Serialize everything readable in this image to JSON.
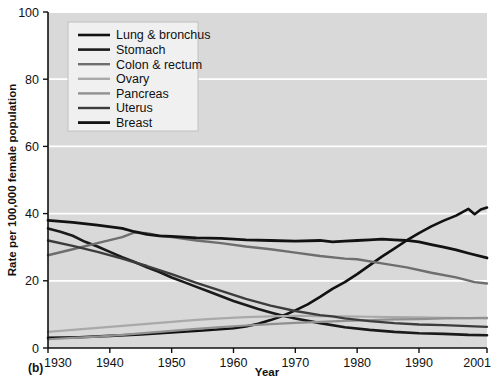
{
  "figure": {
    "panel_label": "(b)"
  },
  "chart_data": {
    "type": "line",
    "title": "",
    "xlabel": "Year",
    "ylabel": "Rate per 100,000 female population",
    "xlim": [
      1930,
      2001
    ],
    "ylim": [
      0,
      100
    ],
    "xticks": [
      1930,
      1940,
      1950,
      1960,
      1970,
      1980,
      1990,
      2001
    ],
    "xtick_labels": [
      "1930",
      "1940",
      "1950",
      "1960",
      "1970",
      "1980",
      "1990",
      "2001"
    ],
    "yticks": [
      0,
      20,
      40,
      60,
      80,
      100
    ],
    "ytick_labels": [
      "0",
      "20",
      "40",
      "60",
      "80",
      "100"
    ],
    "grid": "horizontal-white",
    "plot_background": "#d9d9d9",
    "legend_position": "top-left-inside",
    "series": [
      {
        "name": "Lung & bronchus",
        "color": "#111111",
        "width": 2.6,
        "x": [
          1930,
          1935,
          1940,
          1945,
          1950,
          1955,
          1960,
          1962,
          1964,
          1966,
          1968,
          1970,
          1972,
          1974,
          1976,
          1978,
          1980,
          1982,
          1984,
          1986,
          1988,
          1990,
          1992,
          1994,
          1996,
          1998,
          1999,
          2000,
          2001
        ],
        "values": [
          3.0,
          3.2,
          3.6,
          4.0,
          4.6,
          5.2,
          5.9,
          6.4,
          7.2,
          8.3,
          9.6,
          11.2,
          13.0,
          15.2,
          17.6,
          19.6,
          22.0,
          24.6,
          27.2,
          29.6,
          32.0,
          34.2,
          36.2,
          37.9,
          39.4,
          41.4,
          39.8,
          41.2,
          41.8
        ]
      },
      {
        "name": "Stomach",
        "color": "#1a1a1a",
        "width": 2.6,
        "x": [
          1930,
          1932,
          1934,
          1936,
          1938,
          1940,
          1942,
          1944,
          1946,
          1948,
          1950,
          1952,
          1954,
          1956,
          1958,
          1960,
          1962,
          1964,
          1966,
          1968,
          1970,
          1974,
          1978,
          1982,
          1986,
          1990,
          1994,
          1998,
          2001
        ],
        "values": [
          35.6,
          34.6,
          33.4,
          31.6,
          30.2,
          28.6,
          27.0,
          25.6,
          24.0,
          22.6,
          21.0,
          19.6,
          18.2,
          16.8,
          15.4,
          14.0,
          12.8,
          11.6,
          10.6,
          9.6,
          8.8,
          7.4,
          6.2,
          5.4,
          4.8,
          4.4,
          4.2,
          3.9,
          3.8
        ]
      },
      {
        "name": "Colon & rectum",
        "color": "#6e6e6e",
        "width": 2.4,
        "x": [
          1930,
          1934,
          1938,
          1942,
          1944,
          1946,
          1948,
          1950,
          1954,
          1958,
          1962,
          1966,
          1970,
          1974,
          1978,
          1980,
          1984,
          1988,
          1992,
          1996,
          1999,
          2001
        ],
        "values": [
          27.6,
          29.4,
          31.2,
          33.0,
          34.4,
          34.2,
          33.4,
          33.0,
          32.0,
          31.2,
          30.2,
          29.4,
          28.4,
          27.4,
          26.6,
          26.4,
          25.2,
          24.0,
          22.4,
          21.0,
          19.6,
          19.2
        ]
      },
      {
        "name": "Ovary",
        "color": "#a9a9a9",
        "width": 2.2,
        "x": [
          1930,
          1934,
          1938,
          1942,
          1946,
          1950,
          1954,
          1958,
          1962,
          1966,
          1970,
          1974,
          1978,
          1982,
          1986,
          1990,
          1994,
          1998,
          2001
        ],
        "values": [
          4.8,
          5.4,
          6.0,
          6.6,
          7.2,
          7.8,
          8.4,
          8.8,
          9.2,
          9.4,
          9.6,
          9.5,
          9.4,
          9.3,
          9.2,
          9.1,
          9.0,
          8.9,
          8.8
        ]
      },
      {
        "name": "Pancreas",
        "color": "#909090",
        "width": 2.2,
        "x": [
          1930,
          1934,
          1938,
          1942,
          1946,
          1950,
          1954,
          1958,
          1962,
          1966,
          1970,
          1974,
          1978,
          1982,
          1986,
          1990,
          1994,
          1998,
          2001
        ],
        "values": [
          2.6,
          3.0,
          3.4,
          3.9,
          4.5,
          5.1,
          5.7,
          6.2,
          6.7,
          7.1,
          7.5,
          7.8,
          8.1,
          8.3,
          8.5,
          8.6,
          8.8,
          8.9,
          9.0
        ]
      },
      {
        "name": "Uterus",
        "color": "#3c3c3c",
        "width": 2.4,
        "x": [
          1930,
          1934,
          1938,
          1942,
          1946,
          1950,
          1954,
          1958,
          1962,
          1966,
          1970,
          1974,
          1976,
          1978,
          1982,
          1986,
          1990,
          1994,
          1998,
          2001
        ],
        "values": [
          32.0,
          30.4,
          28.6,
          26.6,
          24.4,
          22.0,
          19.4,
          17.0,
          14.6,
          12.6,
          11.0,
          9.8,
          9.4,
          8.8,
          8.0,
          7.4,
          7.0,
          6.8,
          6.5,
          6.3
        ]
      },
      {
        "name": "Breast",
        "color": "#121212",
        "width": 2.8,
        "x": [
          1930,
          1934,
          1938,
          1942,
          1944,
          1946,
          1948,
          1950,
          1954,
          1958,
          1962,
          1966,
          1970,
          1974,
          1976,
          1978,
          1980,
          1982,
          1984,
          1986,
          1988,
          1990,
          1992,
          1994,
          1996,
          1998,
          2001
        ],
        "values": [
          38.0,
          37.4,
          36.6,
          35.6,
          34.6,
          33.8,
          33.4,
          33.2,
          32.8,
          32.6,
          32.2,
          32.0,
          31.8,
          32.0,
          31.6,
          31.8,
          32.0,
          32.2,
          32.4,
          32.2,
          32.0,
          31.6,
          30.8,
          30.0,
          29.2,
          28.2,
          26.8
        ]
      }
    ]
  }
}
